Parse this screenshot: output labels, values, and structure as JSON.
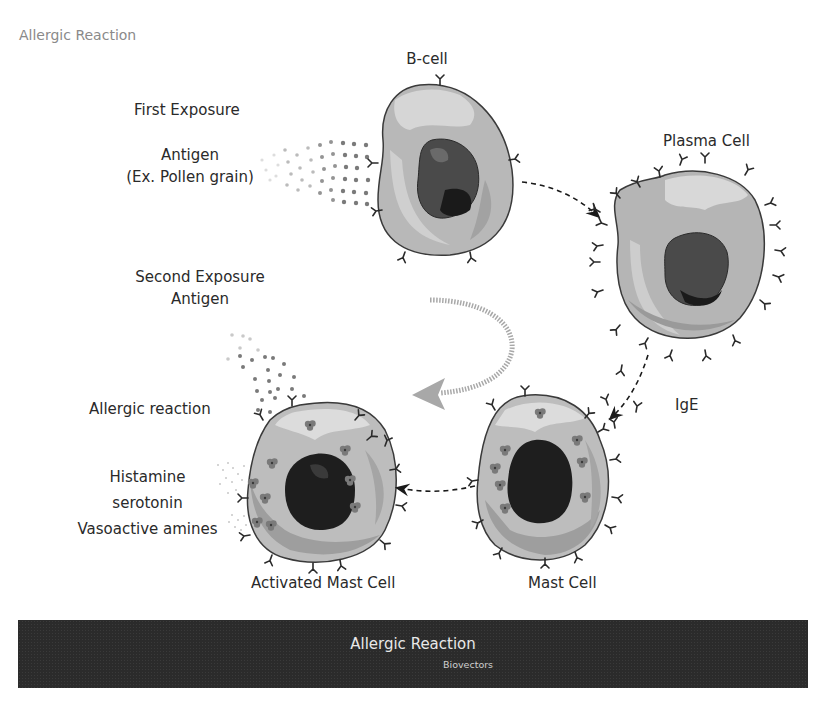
{
  "header": {
    "title": "Allergic Reaction"
  },
  "labels": {
    "b_cell": "B-cell",
    "first_exposure": "First Exposure",
    "antigen": "Antigen",
    "antigen_example": "(Ex. Pollen grain)",
    "plasma_cell": "Plasma Cell",
    "second_exposure": "Second Exposure",
    "second_antigen": "Antigen",
    "ige": "IgE",
    "allergic_reaction": "Allergic reaction",
    "histamine": "Histamine",
    "serotonin": "serotonin",
    "vasoactive_amines": "Vasoactive amines",
    "activated_mast_cell": "Activated Mast Cell",
    "mast_cell": "Mast Cell"
  },
  "footer": {
    "title": "Allergic Reaction",
    "subtitle": "Biovectors"
  },
  "colors": {
    "cytoplasm_light": "#d9d9d9",
    "cytoplasm_mid": "#b5b5b5",
    "cytoplasm_dark": "#9a9a9a",
    "nucleus": "#4a4a4a",
    "nucleus_dark": "#1a1a1a",
    "outline": "#3a3a3a",
    "footer_bg": "#2b2b2b",
    "arrow_gray": "#a8a8a8"
  },
  "flow": [
    {
      "from": "B-cell",
      "to": "Plasma Cell"
    },
    {
      "from": "Plasma Cell",
      "to": "Mast Cell",
      "via": "IgE"
    },
    {
      "from": "Mast Cell",
      "to": "Activated Mast Cell"
    }
  ]
}
